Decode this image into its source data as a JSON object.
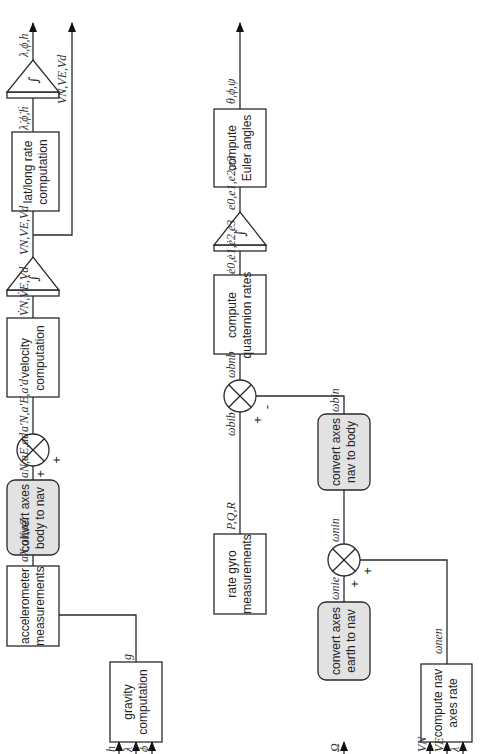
{
  "diagram": {
    "orientation": "rotated-90-ccw",
    "blocks": {
      "accelerometer": [
        "accelerometer",
        "measurements"
      ],
      "body_to_nav": [
        "convert axes",
        "body to nav"
      ],
      "velocity": [
        "velocity",
        "computation"
      ],
      "latlong": [
        "lat/long rate",
        "computation"
      ],
      "gravity": [
        "gravity",
        "computation"
      ],
      "rate_gyro": [
        "rate gyro",
        "measurements"
      ],
      "quaternion": [
        "compute",
        "quaternion rates"
      ],
      "euler": [
        "compute",
        "Euler angles"
      ],
      "nav_to_body": [
        "convert axes",
        "nav to body"
      ],
      "earth_to_nav": [
        "convert axes",
        "earth to nav"
      ],
      "nav_rate": [
        "compute nav",
        "axes rate"
      ]
    },
    "integrator_symbol": "∫",
    "signals": {
      "accel_body": "aX,aY,aZ",
      "accel_nav": "aN,aE,ad",
      "accel_corrected": "a'N,a'E,a'd",
      "vel_dot": "V̇N,V̇E,V̇d",
      "vel": "VN,VE,Vd",
      "vel_out": "VN,VE,Vd",
      "pos_dot": "λ̇,ϕ̇,ḣ",
      "pos_out": "λ,ϕ,h",
      "gravity": "g",
      "gravity_inputs": [
        "h",
        "λ",
        "ϕ"
      ],
      "gyro": "P,Q,R",
      "omega_ib": "ωbib",
      "omega_nb": "ωbnb",
      "omega_in_body": "ωbin",
      "omega_in_nav": "ωnin",
      "omega_ie": "ωnie",
      "omega_en": "ωnen",
      "earth_rate": "Ω",
      "nav_rate_inputs": [
        "VN",
        "VE",
        "λ"
      ],
      "quat_dot": "ė0,ė1,ė2,ė3",
      "quat": "e0,e1,e2,e3",
      "euler_out": "θ,ϕ,ψ"
    },
    "signs": {
      "accel_sum_main": "+",
      "accel_sum_gravity": "+",
      "gyro_sum_main": "+",
      "gyro_sum_feedback": "-",
      "nav_sum_ie": "+",
      "nav_sum_en": "+"
    }
  }
}
